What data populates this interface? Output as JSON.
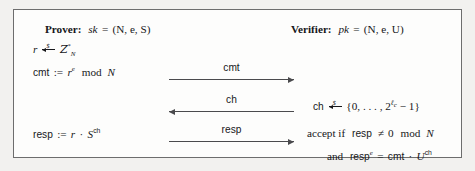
{
  "figure": {
    "kind": "protocol-diagram",
    "border_color": "#6d6d6d",
    "background": "#fdfdfc",
    "page_background": "#f2f1ef"
  },
  "prover": {
    "role_label": "Prover:",
    "key_expr": "sk = (N, e, S)",
    "key_name": "sk",
    "key_value": "(N, e, S)",
    "sample": {
      "var": "r",
      "arrow": "random-sample-arrow",
      "dollar": "$",
      "set": "Z",
      "set_subscript": "N",
      "set_superscript": "*"
    },
    "commit": {
      "name": "cmt",
      "assign": ":=",
      "base": "r",
      "exponent": "e",
      "modop": "mod",
      "modulus": "N"
    },
    "response": {
      "name": "resp",
      "assign": ":=",
      "factor": "r",
      "dot": "·",
      "base": "S",
      "exponent": "ch"
    }
  },
  "verifier": {
    "role_label": "Verifier:",
    "key_expr": "pk = (N, e, U)",
    "key_name": "pk",
    "key_value": "(N, e, U)",
    "challenge": {
      "var": "ch",
      "arrow": "random-sample-arrow",
      "dollar": "$",
      "set_open": "{0, . . . , 2",
      "exp_base": "ℓ",
      "exp_sub": "c",
      "set_close": " − 1}"
    },
    "check_one": {
      "prefix": "accept if",
      "name": "resp",
      "relation": "≠",
      "value": "0",
      "modop": "mod",
      "modulus": "N"
    },
    "check_two": {
      "prefix": "and",
      "lhs_name": "resp",
      "lhs_exponent": "e",
      "equals": "=",
      "rhs_first": "cmt",
      "dot": "·",
      "rhs_base": "U",
      "rhs_exponent": "ch"
    }
  },
  "messages": [
    {
      "label": "cmt",
      "direction": "right"
    },
    {
      "label": "ch",
      "direction": "left"
    },
    {
      "label": "resp",
      "direction": "right"
    }
  ]
}
